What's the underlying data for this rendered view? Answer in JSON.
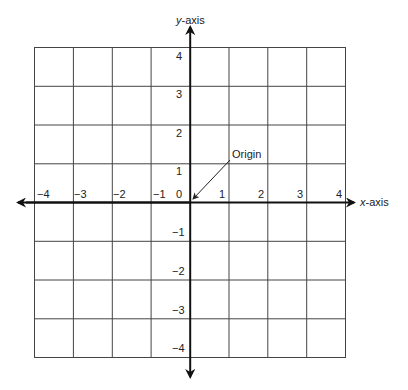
{
  "diagram": {
    "x_axis_label_italic": "x",
    "x_axis_label_rest": "-axis",
    "y_axis_label_italic": "y",
    "y_axis_label_rest": "-axis",
    "origin_label": "Origin",
    "origin_value": "0",
    "x_ticks": [
      "−4",
      "−3",
      "−2",
      "−1",
      "1",
      "2",
      "3",
      "4"
    ],
    "y_ticks_positive": [
      "4",
      "3",
      "2",
      "1"
    ],
    "y_ticks_negative": [
      "−1",
      "−2",
      "−3",
      "−4"
    ],
    "range": {
      "xmin": -4,
      "xmax": 4,
      "ymin": -4,
      "ymax": 4
    },
    "grid": true,
    "colors": {
      "grid": "#444444",
      "axis": "#111111",
      "text": "#222222"
    }
  }
}
